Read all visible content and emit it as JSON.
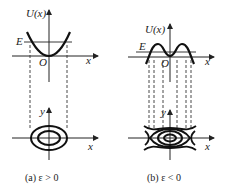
{
  "figure": {
    "panels": [
      {
        "id": "a",
        "potential": {
          "ylabel": "U(x)",
          "xlabel": "x",
          "origin": "O",
          "energy_label": "E"
        },
        "phase": {
          "ylabel": "y",
          "xlabel": "x"
        },
        "caption": "(a)  ε > 0"
      },
      {
        "id": "b",
        "potential": {
          "ylabel": "U(x)",
          "xlabel": "x",
          "origin": "O",
          "energy_label": "E"
        },
        "phase": {
          "ylabel": "y",
          "xlabel": "x"
        },
        "caption": "(b)  ε < 0"
      }
    ]
  }
}
